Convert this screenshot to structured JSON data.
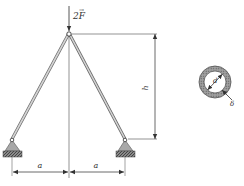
{
  "figure": {
    "force_label": "2F",
    "force_vector_mark": "→",
    "height_label": "h",
    "span_left_label": "a",
    "span_right_label": "a",
    "section_diameter_label": "d",
    "section_thickness_label": "δ"
  },
  "colors": {
    "line": "#555555",
    "bar_fill": "#d0d0d0",
    "support_fill": "#a8a8a8",
    "hatch": "#444444",
    "ring_fill": "#9a9a9a"
  }
}
